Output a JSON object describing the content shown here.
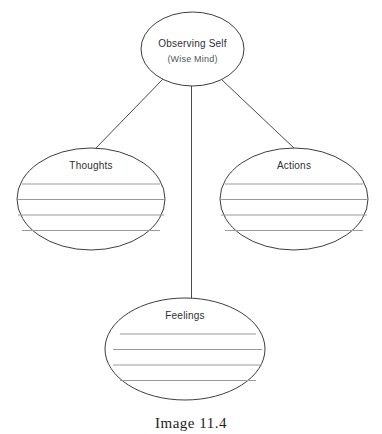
{
  "diagram": {
    "type": "hub-and-spoke worksheet",
    "center_node": {
      "label": "Observing Self",
      "sublabel": "(Wise Mind)",
      "shape": "ellipse",
      "cx": 192.5,
      "cy": 49,
      "rx": 51.5,
      "ry": 37,
      "label_y": 47,
      "sublabel_y": 62,
      "has_write_lines": false
    },
    "branch_nodes": [
      {
        "id": "thoughts",
        "label": "Thoughts",
        "shape": "ellipse",
        "cx": 91,
        "cy": 199,
        "rx": 74,
        "ry": 51,
        "label_y": 169,
        "write_lines": [
          184,
          199.5,
          215,
          230.5
        ]
      },
      {
        "id": "actions",
        "label": "Actions",
        "shape": "ellipse",
        "cx": 294,
        "cy": 199,
        "rx": 74,
        "ry": 51,
        "label_y": 169,
        "write_lines": [
          184,
          199.5,
          215,
          230.5
        ]
      },
      {
        "id": "feelings",
        "label": "Feelings",
        "shape": "ellipse",
        "cx": 185,
        "cy": 349,
        "rx": 80,
        "ry": 51,
        "label_y": 319,
        "write_lines": [
          334,
          349.5,
          365,
          380.5
        ]
      }
    ],
    "connectors": [
      {
        "id": "center-to-thoughts",
        "x1": 163,
        "y1": 79,
        "x2": 95,
        "y2": 149
      },
      {
        "id": "center-to-actions",
        "x1": 221,
        "y1": 79,
        "x2": 295,
        "y2": 149
      },
      {
        "id": "center-to-feelings",
        "x1": 191.5,
        "y1": 86,
        "x2": 191.5,
        "y2": 299
      }
    ],
    "colors": {
      "node_stroke": "#3d3d44",
      "connector_stroke": "#4a4a50",
      "write_line_stroke": "#9a9aa0",
      "label_text": "#2f2f36",
      "sublabel_text": "#55555d",
      "caption_text": "#1d1d22",
      "background": "#ffffff"
    }
  },
  "caption": {
    "text": "Image 11.4"
  }
}
